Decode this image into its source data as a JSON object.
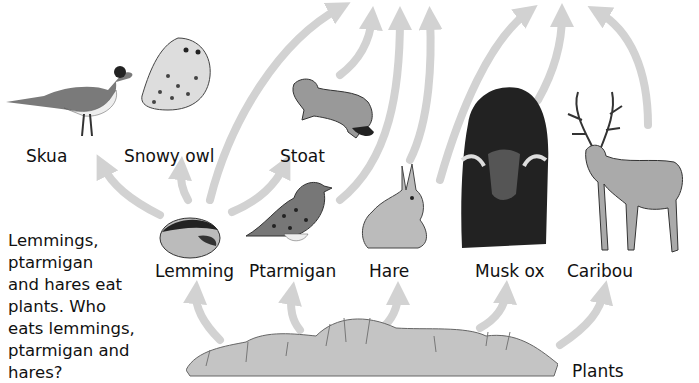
{
  "diagram": {
    "type": "food-web",
    "arrow_color": "#d2d2d2",
    "question_lines": [
      "Lemmings,",
      "ptarmigan",
      "and hares eat",
      "plants. Who",
      "eats lemmings,",
      "ptarmigan and",
      "hares?"
    ],
    "labels": {
      "skua": "Skua",
      "snowy_owl": "Snowy owl",
      "stoat": "Stoat",
      "lemming": "Lemming",
      "ptarmigan": "Ptarmigan",
      "hare": "Hare",
      "musk_ox": "Musk ox",
      "caribou": "Caribou",
      "plants": "Plants"
    },
    "edges": [
      {
        "from": "Plants",
        "to": "Lemming"
      },
      {
        "from": "Plants",
        "to": "Ptarmigan"
      },
      {
        "from": "Plants",
        "to": "Hare"
      },
      {
        "from": "Plants",
        "to": "Musk ox"
      },
      {
        "from": "Plants",
        "to": "Caribou"
      },
      {
        "from": "Lemming",
        "to": "Skua"
      },
      {
        "from": "Lemming",
        "to": "Snowy owl"
      },
      {
        "from": "Lemming",
        "to": "Stoat"
      },
      {
        "from": "Lemming",
        "to": "(off-image)"
      },
      {
        "from": "Ptarmigan",
        "to": "(off-image)"
      },
      {
        "from": "Stoat",
        "to": "(off-image)"
      },
      {
        "from": "Hare",
        "to": "(off-image)"
      },
      {
        "from": "Musk ox",
        "to": "(off-image)"
      },
      {
        "from": "Caribou",
        "to": "(off-image)"
      }
    ]
  }
}
